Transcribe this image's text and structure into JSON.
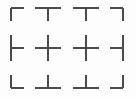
{
  "figure": {
    "width": 136,
    "height": 97,
    "background_color": "#fdfdfd",
    "line_color": "#4a4a4a",
    "line_width": 1.4,
    "arm_length": 13
  },
  "grid": {
    "column_positions": [
      11,
      48,
      86,
      123
    ],
    "row_positions": [
      8,
      48,
      88
    ],
    "column_count": 4,
    "row_count": 3
  },
  "marks": [
    {
      "id": "mark-r1c1",
      "name": "corner-top-left",
      "glyph": "┌",
      "x": 11,
      "y": 8,
      "arms": [
        "right",
        "down"
      ]
    },
    {
      "id": "mark-r1c2",
      "name": "tee-down",
      "glyph": "┬",
      "x": 48,
      "y": 8,
      "arms": [
        "left",
        "right",
        "down"
      ]
    },
    {
      "id": "mark-r1c3",
      "name": "tee-down",
      "glyph": "┬",
      "x": 86,
      "y": 8,
      "arms": [
        "left",
        "right",
        "down"
      ]
    },
    {
      "id": "mark-r1c4",
      "name": "corner-top-right",
      "glyph": "┐",
      "x": 123,
      "y": 8,
      "arms": [
        "left",
        "down"
      ]
    },
    {
      "id": "mark-r2c1",
      "name": "tee-right",
      "glyph": "├",
      "x": 11,
      "y": 48,
      "arms": [
        "up",
        "right",
        "down"
      ]
    },
    {
      "id": "mark-r2c2",
      "name": "cross",
      "glyph": "┼",
      "x": 48,
      "y": 48,
      "arms": [
        "up",
        "right",
        "down",
        "left"
      ]
    },
    {
      "id": "mark-r2c3",
      "name": "cross",
      "glyph": "┼",
      "x": 86,
      "y": 48,
      "arms": [
        "up",
        "right",
        "down",
        "left"
      ]
    },
    {
      "id": "mark-r2c4",
      "name": "tee-left",
      "glyph": "┤",
      "x": 123,
      "y": 48,
      "arms": [
        "up",
        "left",
        "down"
      ]
    },
    {
      "id": "mark-r3c1",
      "name": "corner-bottom-left",
      "glyph": "└",
      "x": 11,
      "y": 88,
      "arms": [
        "up",
        "right"
      ]
    },
    {
      "id": "mark-r3c2",
      "name": "tee-up",
      "glyph": "┴",
      "x": 48,
      "y": 88,
      "arms": [
        "left",
        "right",
        "up"
      ]
    },
    {
      "id": "mark-r3c3",
      "name": "tee-up",
      "glyph": "┴",
      "x": 86,
      "y": 88,
      "arms": [
        "left",
        "right",
        "up"
      ]
    },
    {
      "id": "mark-r3c4",
      "name": "corner-bottom-right",
      "glyph": "┘",
      "x": 123,
      "y": 88,
      "arms": [
        "up",
        "left"
      ]
    }
  ]
}
